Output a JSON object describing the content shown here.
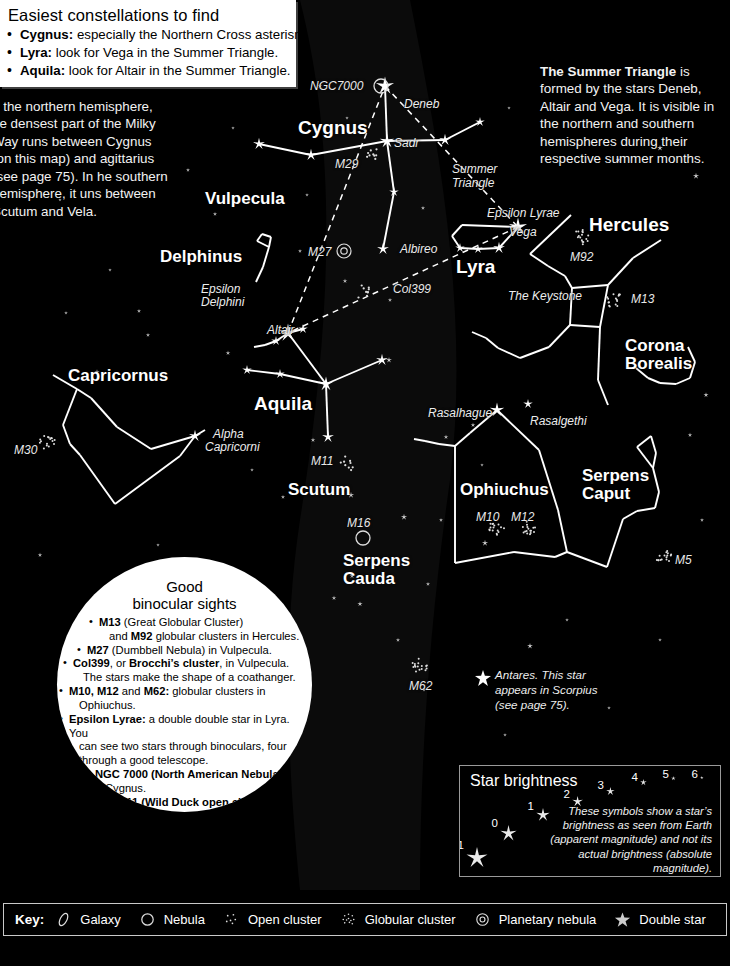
{
  "easiest": {
    "title": "Easiest constellations to find",
    "items": [
      {
        "name": "Cygnus:",
        "text": " especially the Northern Cross asterism."
      },
      {
        "name": "Lyra:",
        "text": " look for Vega in the Summer Triangle."
      },
      {
        "name": "Aquila:",
        "text": " look for Altair in the Summer Triangle."
      }
    ]
  },
  "milky_way_note": "n the northern hemisphere, he densest part of the Milky Way runs between Cygnus (on this map) and agittarius (see page 75). In he southern hemisphere, it uns between Scutum and Vela.",
  "summer_triangle_note": {
    "bold": "The Summer Triangle",
    "rest": " is formed by the stars Deneb, Altair and Vega. It is visible in the northern and southern hemispheres during their respective summer months."
  },
  "constellations": [
    {
      "label": "Cygnus",
      "x": 298,
      "y": 118,
      "size": "big"
    },
    {
      "label": "Vulpecula",
      "x": 205,
      "y": 190,
      "size": "med"
    },
    {
      "label": "Delphinus",
      "x": 160,
      "y": 248,
      "size": "med"
    },
    {
      "label": "Capricornus",
      "x": 68,
      "y": 367,
      "size": "med"
    },
    {
      "label": "Aquila",
      "x": 254,
      "y": 394,
      "size": "big"
    },
    {
      "label": "Scutum",
      "x": 288,
      "y": 481,
      "size": "med"
    },
    {
      "label": "Lyra",
      "x": 456,
      "y": 257,
      "size": "big"
    },
    {
      "label": "Hercules",
      "x": 589,
      "y": 215,
      "size": "big"
    },
    {
      "label": "Ophiuchus",
      "x": 460,
      "y": 481,
      "size": "med"
    },
    {
      "label": "M5",
      "x": 0,
      "y": 0,
      "size": "sm"
    }
  ],
  "constellations_two_line": [
    {
      "l1": "Corona",
      "l2": "Borealis",
      "x": 625,
      "y": 337,
      "size": "med"
    },
    {
      "l1": "Serpens",
      "l2": "Caput",
      "x": 582,
      "y": 467,
      "size": "med"
    },
    {
      "l1": "Serpens",
      "l2": "Cauda",
      "x": 343,
      "y": 552,
      "size": "med"
    }
  ],
  "deep_sky_labels": [
    {
      "label": "NGC7000",
      "x": 310,
      "y": 80
    },
    {
      "label": "M29",
      "x": 335,
      "y": 158
    },
    {
      "label": "M27",
      "x": 308,
      "y": 246
    },
    {
      "label": "Col399",
      "x": 393,
      "y": 283
    },
    {
      "label": "M92",
      "x": 570,
      "y": 251
    },
    {
      "label": "M13",
      "x": 631,
      "y": 293
    },
    {
      "label": "M30",
      "x": 14,
      "y": 444
    },
    {
      "label": "M11",
      "x": 311,
      "y": 455
    },
    {
      "label": "M16",
      "x": 347,
      "y": 517
    },
    {
      "label": "M10",
      "x": 476,
      "y": 511
    },
    {
      "label": "M12",
      "x": 511,
      "y": 511
    },
    {
      "label": "M5",
      "x": 675,
      "y": 554
    },
    {
      "label": "M62",
      "x": 409,
      "y": 680
    }
  ],
  "star_labels": [
    {
      "label": "Deneb",
      "x": 404,
      "y": 98
    },
    {
      "label": "Sadr",
      "x": 394,
      "y": 137
    },
    {
      "label": "Summer",
      "x": 452,
      "y": 163
    },
    {
      "label": "Triangle",
      "x": 452,
      "y": 177
    },
    {
      "label": "Epsilon Lyrae",
      "x": 487,
      "y": 207
    },
    {
      "label": "Vega",
      "x": 509,
      "y": 226
    },
    {
      "label": "Albireo",
      "x": 400,
      "y": 243
    },
    {
      "label": "Epsilon",
      "x": 201,
      "y": 283
    },
    {
      "label": "Delphini",
      "x": 201,
      "y": 296
    },
    {
      "label": "The Keystone",
      "x": 508,
      "y": 290
    },
    {
      "label": "Altair",
      "x": 267,
      "y": 324
    },
    {
      "label": "Alpha",
      "x": 213,
      "y": 428
    },
    {
      "label": "Capricorni",
      "x": 205,
      "y": 441
    },
    {
      "label": "Rasalhague",
      "x": 428,
      "y": 407
    },
    {
      "label": "Rasalgethi",
      "x": 530,
      "y": 415
    }
  ],
  "antares_note": "Antares. This star appears in Scorpius (see page 75).",
  "binocular": {
    "title_line1": "Good",
    "title_line2": "binocular sights",
    "items": [
      {
        "cls": "c1",
        "html": "<b>M13</b> (Great Globular Cluster)",
        "cont": "and <b>M92</b> globular clusters in Hercules."
      },
      {
        "cls": "c2",
        "html": "<b>M27</b> (Dumbbell Nebula) in Vulpecula.",
        "cont": ""
      },
      {
        "cls": "c3",
        "html": "<b>Col399</b>, or <b>Brocchi’s cluster</b>, in Vulpecula.",
        "cont": "The stars make the shape of a coathanger."
      },
      {
        "cls": "c4",
        "html": "<b>M10, M12</b> and <b>M62:</b> globular clusters in",
        "cont": "Ophiuchus."
      },
      {
        "cls": "c4",
        "html": "<b>Epsilon Lyrae:</b> a double double star in Lyra. You",
        "cont": "can see two stars through binoculars, four|through a good telescope."
      },
      {
        "cls": "c5",
        "html": "<b>NGC 7000 (North American Nebula)</b> in",
        "cont": "Cygnus."
      },
      {
        "cls": "c6",
        "html": "<b>M11 (Wild Duck open cluster)</b> in",
        "cont": "Scutum."
      },
      {
        "cls": "c7",
        "html": "<b>M5:</b> globular cluster in",
        "cont": "Serpens."
      }
    ]
  },
  "brightness": {
    "title": "Star brightness",
    "description": "These symbols show a star’s brightness as seen from Earth (apparent magnitude) and not its actual brightness (absolute magnitude).",
    "scale": [
      {
        "mag": "-1",
        "x": 6,
        "y": 81,
        "r": 11.0
      },
      {
        "mag": "0",
        "x": 40,
        "y": 59,
        "r": 8.5
      },
      {
        "mag": "1",
        "x": 76,
        "y": 42,
        "r": 7.0
      },
      {
        "mag": "2",
        "x": 112,
        "y": 30,
        "r": 5.6
      },
      {
        "mag": "3",
        "x": 146,
        "y": 21,
        "r": 4.4
      },
      {
        "mag": "4",
        "x": 180,
        "y": 13,
        "r": 3.4
      },
      {
        "mag": "5",
        "x": 211,
        "y": 10,
        "r": 2.4
      },
      {
        "mag": "6",
        "x": 240,
        "y": 10,
        "r": 1.8
      }
    ]
  },
  "key": {
    "label": "Key:",
    "items": [
      {
        "icon": "galaxy-icon",
        "label": "Galaxy"
      },
      {
        "icon": "nebula-icon",
        "label": "Nebula"
      },
      {
        "icon": "open-cluster-icon",
        "label": "Open cluster"
      },
      {
        "icon": "globular-cluster-icon",
        "label": "Globular cluster"
      },
      {
        "icon": "planetary-nebula-icon",
        "label": "Planetary nebula"
      },
      {
        "icon": "double-star-icon",
        "label": "Double star"
      }
    ]
  },
  "chart_data": {
    "type": "scatter",
    "stars": [
      {
        "n": "Deneb",
        "x": 385,
        "y": 86,
        "m": -1
      },
      {
        "n": "Sadr",
        "x": 387,
        "y": 141,
        "m": 0
      },
      {
        "n": "cyg-w2",
        "x": 311,
        "y": 155,
        "m": 1
      },
      {
        "n": "cyg-w1",
        "x": 259,
        "y": 144,
        "m": 1
      },
      {
        "n": "cyg-e1",
        "x": 445,
        "y": 140,
        "m": 1
      },
      {
        "n": "cyg-e2",
        "x": 480,
        "y": 122,
        "m": 2
      },
      {
        "n": "cyg-mid",
        "x": 394,
        "y": 192,
        "m": 2
      },
      {
        "n": "Albireo",
        "x": 383,
        "y": 249,
        "m": 1
      },
      {
        "n": "Vega",
        "x": 518,
        "y": 227,
        "m": -1
      },
      {
        "n": "lyr-b",
        "x": 499,
        "y": 248,
        "m": 1
      },
      {
        "n": "lyr-c",
        "x": 460,
        "y": 248,
        "m": 2
      },
      {
        "n": "lyr-d",
        "x": 478,
        "y": 249,
        "m": 2
      },
      {
        "n": "Altair",
        "x": 288,
        "y": 333,
        "m": -1
      },
      {
        "n": "aql-n",
        "x": 303,
        "y": 329,
        "m": 2
      },
      {
        "n": "aql-s",
        "x": 276,
        "y": 341,
        "m": 2
      },
      {
        "n": "aql-c",
        "x": 326,
        "y": 384,
        "m": 0
      },
      {
        "n": "aql-w1",
        "x": 280,
        "y": 374,
        "m": 2
      },
      {
        "n": "aql-w2",
        "x": 247,
        "y": 370,
        "m": 2
      },
      {
        "n": "aql-e",
        "x": 382,
        "y": 360,
        "m": 1
      },
      {
        "n": "aql-tail",
        "x": 328,
        "y": 437,
        "m": 1
      },
      {
        "n": "Rasalhague",
        "x": 497,
        "y": 410,
        "m": 0
      },
      {
        "n": "Rasalgethi",
        "x": 528,
        "y": 404,
        "m": 2
      },
      {
        "n": "alpha-cap",
        "x": 195,
        "y": 436,
        "m": 1
      }
    ],
    "deep_sky_objects": [
      {
        "n": "NGC7000",
        "type": "nebula",
        "x": 381,
        "y": 86
      },
      {
        "n": "M29",
        "type": "open cluster",
        "x": 371,
        "y": 155
      },
      {
        "n": "M27",
        "type": "planetary nebula",
        "x": 344,
        "y": 251
      },
      {
        "n": "Col399",
        "type": "open cluster",
        "x": 363,
        "y": 291
      },
      {
        "n": "M92",
        "type": "globular cluster",
        "x": 581,
        "y": 237
      },
      {
        "n": "M13",
        "type": "globular cluster",
        "x": 614,
        "y": 300
      },
      {
        "n": "M30",
        "type": "globular cluster",
        "x": 47,
        "y": 442
      },
      {
        "n": "M11",
        "type": "open cluster",
        "x": 348,
        "y": 463
      },
      {
        "n": "M16",
        "type": "nebula",
        "x": 363,
        "y": 538
      },
      {
        "n": "M10",
        "type": "globular cluster",
        "x": 497,
        "y": 527
      },
      {
        "n": "M12",
        "type": "globular cluster",
        "x": 528,
        "y": 527
      },
      {
        "n": "M5",
        "type": "globular cluster",
        "x": 664,
        "y": 557
      },
      {
        "n": "M62",
        "type": "globular cluster",
        "x": 420,
        "y": 665
      }
    ],
    "asterisms": [
      {
        "n": "Summer Triangle",
        "vertices": [
          "Deneb",
          "Vega",
          "Altair"
        ],
        "style": "dashed"
      },
      {
        "n": "Northern Cross",
        "constellation": "Cygnus",
        "style": "solid"
      },
      {
        "n": "The Keystone",
        "constellation": "Hercules",
        "style": "solid"
      }
    ],
    "xlabel": "",
    "ylabel": "",
    "grid": false,
    "legend": "bottom"
  }
}
